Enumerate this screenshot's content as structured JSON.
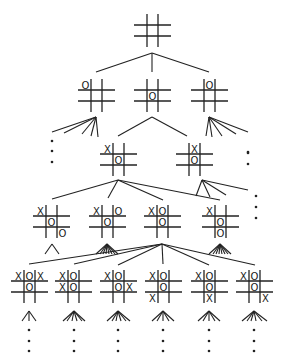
{
  "style": {
    "line_color": "#222222",
    "background": "#ffffff",
    "mark_size": 10
  },
  "boards": [
    {
      "id": "root",
      "level": 0,
      "x": 136,
      "y": 14,
      "size": 33,
      "marks": [
        "",
        "",
        "",
        "",
        "",
        "",
        "",
        "",
        ""
      ]
    },
    {
      "id": "L1a",
      "level": 1,
      "x": 80,
      "y": 79,
      "size": 33,
      "marks": [
        "O",
        "",
        "",
        "",
        "",
        "",
        "",
        "",
        ""
      ]
    },
    {
      "id": "L1b",
      "level": 1,
      "x": 136,
      "y": 79,
      "size": 33,
      "marks": [
        "",
        "",
        "",
        "",
        "O",
        "",
        "",
        "",
        ""
      ]
    },
    {
      "id": "L1c",
      "level": 1,
      "x": 193,
      "y": 79,
      "size": 33,
      "marks": [
        "",
        "O",
        "",
        "",
        "",
        "",
        "",
        "",
        ""
      ]
    },
    {
      "id": "L2a",
      "level": 2,
      "x": 102,
      "y": 143,
      "size": 33,
      "marks": [
        "X",
        "",
        "",
        "",
        "O",
        "",
        "",
        "",
        ""
      ]
    },
    {
      "id": "L2b",
      "level": 2,
      "x": 178,
      "y": 143,
      "size": 33,
      "marks": [
        "",
        "X",
        "",
        "",
        "O",
        "",
        "",
        "",
        ""
      ]
    },
    {
      "id": "L3a",
      "level": 3,
      "x": 35,
      "y": 205,
      "size": 33,
      "marks": [
        "X",
        "",
        "",
        "",
        "O",
        "",
        "",
        "",
        "O"
      ]
    },
    {
      "id": "L3b",
      "level": 3,
      "x": 91,
      "y": 205,
      "size": 33,
      "marks": [
        "X",
        "",
        "O",
        "",
        "O",
        "",
        "",
        "",
        ""
      ]
    },
    {
      "id": "L3c",
      "level": 3,
      "x": 146,
      "y": 205,
      "size": 33,
      "marks": [
        "X",
        "O",
        "",
        "",
        "O",
        "",
        "",
        "",
        ""
      ]
    },
    {
      "id": "L3d",
      "level": 3,
      "x": 204,
      "y": 205,
      "size": 33,
      "marks": [
        "X",
        "",
        "",
        "",
        "O",
        "",
        "",
        "O",
        ""
      ]
    },
    {
      "id": "L4a",
      "level": 4,
      "x": 13,
      "y": 270,
      "size": 33,
      "marks": [
        "X",
        "O",
        "X",
        "",
        "O",
        "",
        "",
        "",
        ""
      ]
    },
    {
      "id": "L4b",
      "level": 4,
      "x": 57,
      "y": 270,
      "size": 33,
      "marks": [
        "X",
        "O",
        "",
        "X",
        "O",
        "",
        "",
        "",
        ""
      ]
    },
    {
      "id": "L4c",
      "level": 4,
      "x": 102,
      "y": 270,
      "size": 33,
      "marks": [
        "X",
        "O",
        "",
        "",
        "O",
        "X",
        "",
        "",
        ""
      ]
    },
    {
      "id": "L4d",
      "level": 4,
      "x": 147,
      "y": 270,
      "size": 33,
      "marks": [
        "X",
        "O",
        "",
        "",
        "O",
        "",
        "X",
        "",
        ""
      ]
    },
    {
      "id": "L4e",
      "level": 4,
      "x": 193,
      "y": 270,
      "size": 33,
      "marks": [
        "X",
        "O",
        "",
        "",
        "O",
        "",
        "",
        "X",
        ""
      ]
    },
    {
      "id": "L4f",
      "level": 4,
      "x": 238,
      "y": 270,
      "size": 33,
      "marks": [
        "X",
        "O",
        "",
        "",
        "O",
        "",
        "",
        "",
        "X"
      ]
    }
  ],
  "edges": [
    [
      152,
      53,
      96,
      72
    ],
    [
      152,
      53,
      152,
      72
    ],
    [
      152,
      53,
      209,
      72
    ],
    [
      96,
      117,
      52,
      132
    ],
    [
      96,
      117,
      64,
      133
    ],
    [
      96,
      117,
      82,
      134
    ],
    [
      96,
      117,
      91,
      136
    ],
    [
      96,
      117,
      98,
      137
    ],
    [
      152,
      117,
      118,
      136
    ],
    [
      152,
      117,
      187,
      136
    ],
    [
      209,
      117,
      206,
      136
    ],
    [
      209,
      117,
      212,
      137
    ],
    [
      209,
      117,
      222,
      136
    ],
    [
      209,
      117,
      236,
      134
    ],
    [
      209,
      117,
      248,
      132
    ],
    [
      118,
      180,
      52,
      199
    ],
    [
      118,
      180,
      108,
      198
    ],
    [
      118,
      180,
      163,
      200
    ],
    [
      118,
      180,
      220,
      200
    ],
    [
      202,
      180,
      196,
      196
    ],
    [
      202,
      180,
      210,
      197
    ],
    [
      202,
      180,
      226,
      195
    ],
    [
      202,
      180,
      248,
      190
    ],
    [
      162,
      244,
      29,
      264
    ],
    [
      162,
      244,
      74,
      264
    ],
    [
      162,
      244,
      118,
      265
    ],
    [
      162,
      244,
      163,
      264
    ],
    [
      162,
      244,
      209,
      265
    ],
    [
      162,
      244,
      255,
      265
    ]
  ],
  "fans": [
    {
      "x": 52,
      "y": 244,
      "spread": [
        -7,
        7
      ]
    },
    {
      "x": 107,
      "y": 244,
      "spread": [
        -11,
        -7,
        -4,
        -1,
        2,
        5,
        8,
        11
      ]
    },
    {
      "x": 220,
      "y": 244,
      "spread": [
        -11,
        -7,
        -4,
        -1,
        2,
        5,
        8,
        11
      ]
    },
    {
      "x": 29,
      "y": 311,
      "spread": [
        -7,
        0,
        7
      ]
    },
    {
      "x": 74,
      "y": 311,
      "spread": [
        -11,
        -7,
        -2,
        3,
        8,
        11
      ]
    },
    {
      "x": 118,
      "y": 311,
      "spread": [
        -11,
        -6,
        -2,
        3,
        8,
        12
      ]
    },
    {
      "x": 163,
      "y": 311,
      "spread": [
        -11,
        -6,
        0,
        6,
        11
      ]
    },
    {
      "x": 209,
      "y": 311,
      "spread": [
        -11,
        -6,
        0,
        6,
        11
      ]
    },
    {
      "x": 254,
      "y": 311,
      "spread": [
        -12,
        -7,
        -3,
        2,
        8,
        13
      ]
    }
  ],
  "ellipses": [
    {
      "x": 52,
      "y": [
        141,
        151,
        162
      ]
    },
    {
      "x": 248,
      "y": [
        153,
        152,
        164
      ]
    },
    {
      "x": 256,
      "y": [
        196,
        207,
        218
      ]
    },
    {
      "x": 29,
      "y": [
        330,
        341,
        351
      ]
    },
    {
      "x": 74,
      "y": [
        330,
        341,
        351
      ]
    },
    {
      "x": 118,
      "y": [
        330,
        341,
        351
      ]
    },
    {
      "x": 163,
      "y": [
        330,
        341,
        351
      ]
    },
    {
      "x": 209,
      "y": [
        330,
        341,
        351
      ]
    },
    {
      "x": 254,
      "y": [
        330,
        341,
        351
      ]
    }
  ]
}
